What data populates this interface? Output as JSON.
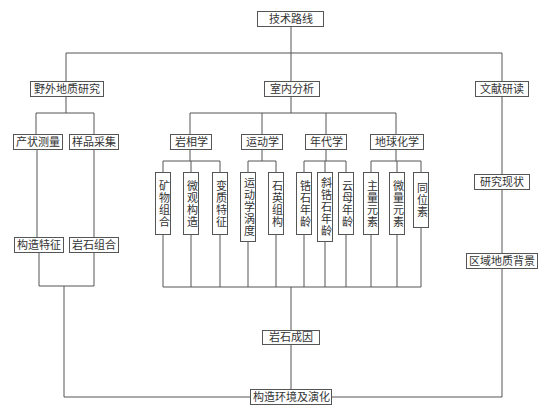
{
  "title": "技术路线",
  "branches": {
    "field": {
      "label": "野外地质研究",
      "children": [
        "产状测量",
        "样品采集"
      ],
      "results": [
        "构造特征",
        "岩石组合"
      ]
    },
    "lab": {
      "label": "室内分析",
      "groups": [
        {
          "label": "岩相学",
          "items": [
            "矿物组合",
            "微观构造",
            "变质特征"
          ]
        },
        {
          "label": "运动学",
          "items": [
            "运动学涡度",
            "石英组构"
          ]
        },
        {
          "label": "年代学",
          "items": [
            "锆石年龄",
            "斜锆石年龄",
            "云母年龄"
          ]
        },
        {
          "label": "地球化学",
          "items": [
            "主量元素",
            "微量元素",
            "同位素"
          ]
        }
      ]
    },
    "literature": {
      "label": "文献研读",
      "children": [
        "研究现状",
        "区域地质背景"
      ]
    }
  },
  "petrogenesis": "岩石成因",
  "conclusion": "构造环境及演化",
  "colors": {
    "line": "#555555",
    "text": "#333333",
    "background": "#ffffff"
  }
}
